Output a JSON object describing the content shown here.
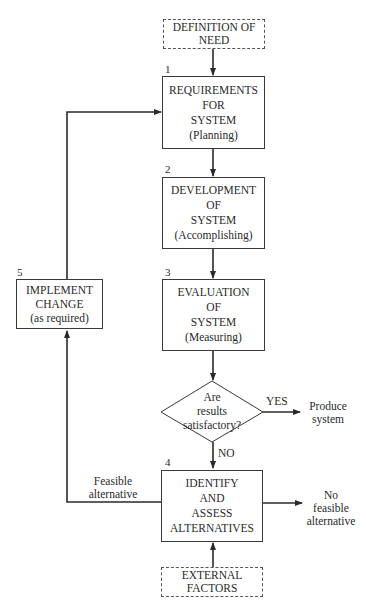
{
  "diagram": {
    "type": "flowchart",
    "nodes": {
      "definition_of_need": {
        "lines": [
          "DEFINITION OF",
          "NEED"
        ],
        "style": "dashed"
      },
      "requirements": {
        "number": "1",
        "lines": [
          "REQUIREMENTS",
          "FOR",
          "SYSTEM",
          "(Planning)"
        ]
      },
      "development": {
        "number": "2",
        "lines": [
          "DEVELOPMENT",
          "OF",
          "SYSTEM",
          "(Accomplishing)"
        ]
      },
      "evaluation": {
        "number": "3",
        "lines": [
          "EVALUATION",
          "OF",
          "SYSTEM",
          "(Measuring)"
        ]
      },
      "decision": {
        "lines": [
          "Are",
          "results",
          "satisfactory?"
        ]
      },
      "identify": {
        "number": "4",
        "lines": [
          "IDENTIFY",
          "AND",
          "ASSESS",
          "ALTERNATIVES"
        ]
      },
      "implement": {
        "number": "5",
        "lines": [
          "IMPLEMENT",
          "CHANGE",
          "(as required)"
        ]
      },
      "external_factors": {
        "lines": [
          "EXTERNAL",
          "FACTORS"
        ],
        "style": "dashed"
      }
    },
    "edge_labels": {
      "yes": "YES",
      "no": "NO",
      "feasible": [
        "Feasible",
        "alternative"
      ]
    },
    "terminals": {
      "produce_system": [
        "Produce",
        "system"
      ],
      "no_feasible": [
        "No",
        "feasible",
        "alternative"
      ]
    },
    "colors": {
      "stroke": "#2a2a2a",
      "text": "#2a2a2a",
      "background": "#ffffff"
    }
  }
}
